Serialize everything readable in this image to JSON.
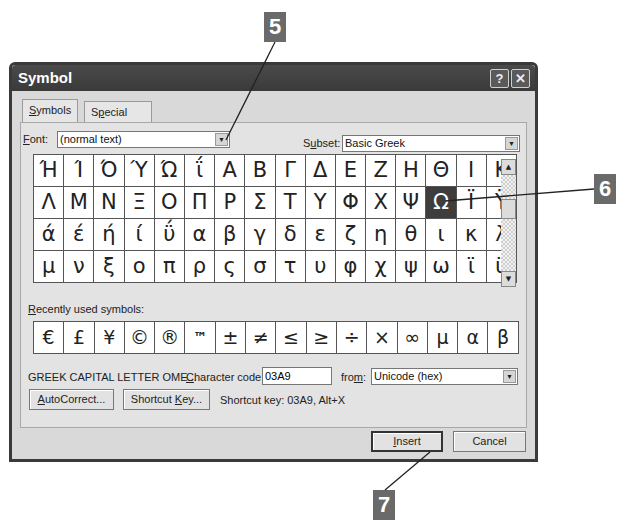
{
  "callouts": [
    {
      "id": "5",
      "label": "5"
    },
    {
      "id": "6",
      "label": "6"
    },
    {
      "id": "7",
      "label": "7"
    }
  ],
  "dialog": {
    "title": "Symbol",
    "help_button": "?",
    "close_button": "✕",
    "tabs": [
      {
        "label": "Symbols",
        "active": true
      },
      {
        "label": "Special Characters",
        "active": false
      }
    ],
    "font": {
      "label": "Font:",
      "value": "(normal text)"
    },
    "subset": {
      "label": "Subset:",
      "value": "Basic Greek"
    },
    "symbol_grid": [
      [
        "Ή",
        "Ί",
        "Ό",
        "Ύ",
        "Ώ",
        "ΐ",
        "Α",
        "Β",
        "Γ",
        "Δ",
        "Ε",
        "Ζ",
        "Η",
        "Θ",
        "Ι",
        "Κ"
      ],
      [
        "Λ",
        "Μ",
        "Ν",
        "Ξ",
        "Ο",
        "Π",
        "Ρ",
        "Σ",
        "Τ",
        "Υ",
        "Φ",
        "Χ",
        "Ψ",
        "Ω",
        "Ϊ",
        "Ϋ"
      ],
      [
        "ά",
        "έ",
        "ή",
        "ί",
        "ΰ",
        "α",
        "β",
        "γ",
        "δ",
        "ε",
        "ζ",
        "η",
        "θ",
        "ι",
        "κ",
        "λ"
      ],
      [
        "μ",
        "ν",
        "ξ",
        "ο",
        "π",
        "ρ",
        "ς",
        "σ",
        "τ",
        "υ",
        "φ",
        "χ",
        "ψ",
        "ω",
        "ϊ",
        "ϋ"
      ]
    ],
    "selected_symbol": {
      "row": 1,
      "col": 13,
      "char": "Ω"
    },
    "scrollbar": {
      "up": "▲",
      "down": "▼"
    },
    "recent_label": "Recently used symbols:",
    "recent_symbols": [
      "€",
      "£",
      "¥",
      "©",
      "®",
      "™",
      "±",
      "≠",
      "≤",
      "≥",
      "÷",
      "×",
      "∞",
      "µ",
      "α",
      "β"
    ],
    "character_name": "GREEK CAPITAL LETTER OME...",
    "character_code": {
      "label": "Character code:",
      "value": "03A9"
    },
    "from": {
      "label": "from:",
      "value": "Unicode (hex)"
    },
    "autocorrect_button": "AutoCorrect...",
    "shortcut_key_button": "Shortcut Key...",
    "shortcut_text": "Shortcut key: 03A9, Alt+X",
    "insert_button": "Insert",
    "cancel_button": "Cancel"
  }
}
